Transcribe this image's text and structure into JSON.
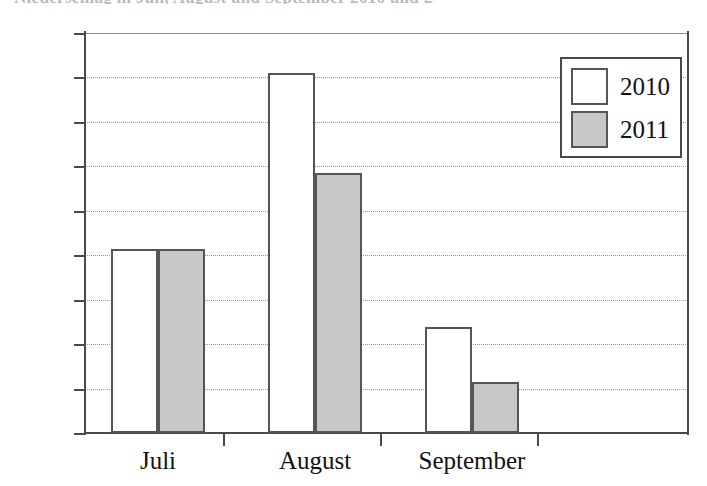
{
  "heading_remnant": "Niederschlag in Juli, August und September 2010 und 2011",
  "chart_data": {
    "type": "bar",
    "title": "",
    "subtitle": "",
    "xlabel": "",
    "ylabel": "",
    "categories": [
      "Juli",
      "August",
      "September"
    ],
    "series": [
      {
        "name": "2010",
        "color": "#ffffff",
        "values": [
          61.5,
          101,
          43.8
        ]
      },
      {
        "name": "2011",
        "color": "#c8c8c8",
        "values": [
          61.5,
          78.5,
          31.5
        ]
      }
    ],
    "ylim": [
      20,
      110
    ],
    "ytick_step": 10,
    "yticks": [
      110,
      100,
      90,
      80,
      70,
      60,
      50,
      40,
      30,
      20
    ],
    "ytick_labels": [
      "110",
      "100",
      "90",
      "80",
      "70",
      "60",
      "50",
      "40",
      "30",
      "20"
    ],
    "grid": true,
    "grid_axis": "y",
    "legend": [
      "2010",
      "2011"
    ],
    "legend_position": "top-right",
    "annotations": []
  },
  "legend": {
    "items": [
      {
        "label": "2010",
        "swatch": "white-square-swatch"
      },
      {
        "label": "2011",
        "swatch": "gray-square-swatch"
      }
    ]
  },
  "axes": {
    "y_ticks": [
      "110",
      "100",
      "90",
      "80",
      "70",
      "60",
      "50",
      "40",
      "30",
      "20"
    ],
    "x_categories": [
      "Juli",
      "August",
      "September"
    ]
  }
}
